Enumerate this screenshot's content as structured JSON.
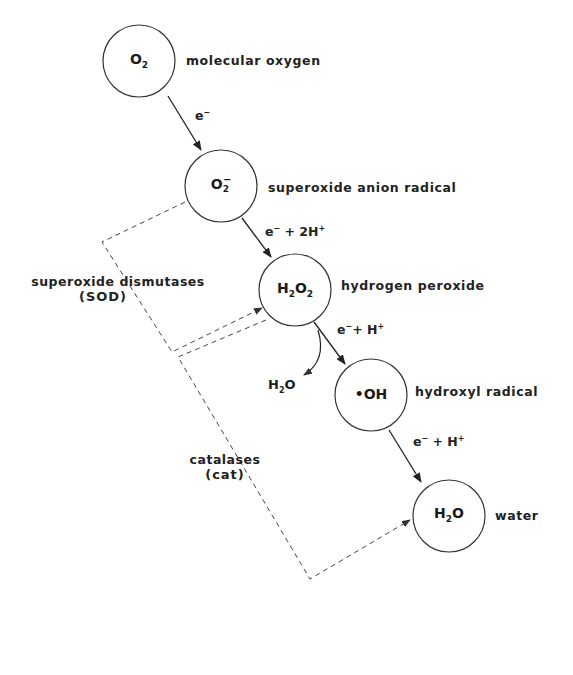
{
  "diagram": {
    "type": "reaction-pathway",
    "nodes": [
      {
        "id": "o2",
        "base": "O",
        "sub": "2",
        "sup": "",
        "prefix": "",
        "label": "molecular oxygen"
      },
      {
        "id": "superoxide",
        "base": "O",
        "sub": "2",
        "sup": "−",
        "prefix": "",
        "label": "superoxide anion radical"
      },
      {
        "id": "h2o2",
        "formula_parts": [
          "H",
          "2",
          "O",
          "2"
        ],
        "label": "hydrogen peroxide"
      },
      {
        "id": "hydroxyl",
        "formula": "•OH",
        "label": "hydroxyl radical"
      },
      {
        "id": "water",
        "formula_parts": [
          "H",
          "2",
          "O"
        ],
        "label": "water"
      }
    ],
    "steps": [
      {
        "from": "o2",
        "to": "superoxide",
        "reagent_e": "e",
        "reagent_e_sup": "−",
        "reagent_rest": "",
        "reagent_rest_sup": ""
      },
      {
        "from": "superoxide",
        "to": "h2o2",
        "reagent_e": "e",
        "reagent_e_sup": "−",
        "reagent_rest": " + 2H",
        "reagent_rest_sup": "+"
      },
      {
        "from": "h2o2",
        "to": "hydroxyl",
        "reagent_e": "e",
        "reagent_e_sup": "−",
        "reagent_rest": "+ H",
        "reagent_rest_sup": "+"
      },
      {
        "from": "hydroxyl",
        "to": "water",
        "reagent_e": "e",
        "reagent_e_sup": "−",
        "reagent_rest": " + H",
        "reagent_rest_sup": "+"
      }
    ],
    "side_product": {
      "parts": [
        "H",
        "2",
        "O"
      ]
    },
    "enzymes": [
      {
        "name": "superoxide dismutases",
        "abbr": "(SOD)",
        "from": "superoxide",
        "to": "h2o2"
      },
      {
        "name": "catalases",
        "abbr": "(cat)",
        "from": "h2o2",
        "to": "water"
      }
    ]
  }
}
